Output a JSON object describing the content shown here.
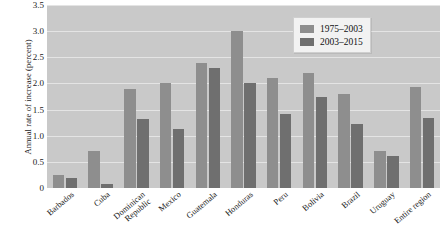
{
  "chart_data": {
    "type": "bar",
    "title": "",
    "xlabel": "",
    "ylabel": "Annual rate of increase (percent)",
    "ylim": [
      0,
      3.5
    ],
    "yticks": [
      "0",
      "0.5",
      "1.0",
      "1.5",
      "2.0",
      "2.5",
      "3.0",
      "3.5"
    ],
    "ytick_values": [
      0,
      0.5,
      1.0,
      1.5,
      2.0,
      2.5,
      3.0,
      3.5
    ],
    "grid": true,
    "legend_position": "top-right",
    "categories": [
      "Barbados",
      "Cuba",
      "Dominican Republic",
      "Mexico",
      "Guatemala",
      "Honduras",
      "Peru",
      "Bolivia",
      "Brazil",
      "Uruguay",
      "Entire region"
    ],
    "category_lines": [
      [
        "Barbados"
      ],
      [
        "Cuba"
      ],
      [
        "Dominican",
        "Republic"
      ],
      [
        "Mexico"
      ],
      [
        "Guatemala"
      ],
      [
        "Honduras"
      ],
      [
        "Peru"
      ],
      [
        "Bolivia"
      ],
      [
        "Brazil"
      ],
      [
        "Uruguay"
      ],
      [
        "Entire region"
      ]
    ],
    "series": [
      {
        "name": "1975–2003",
        "color": "#8e8e8e",
        "values": [
          0.25,
          0.7,
          1.9,
          2.0,
          2.4,
          3.0,
          2.1,
          2.2,
          1.8,
          0.7,
          1.93
        ]
      },
      {
        "name": "2003–2015",
        "color": "#6f6f6f",
        "values": [
          0.2,
          0.08,
          1.32,
          1.12,
          2.3,
          2.0,
          1.42,
          1.75,
          1.22,
          0.62,
          1.33
        ]
      }
    ]
  },
  "legend": {
    "items": [
      {
        "label": "1975–2003",
        "swatch": "series-0-swatch"
      },
      {
        "label": "2003–2015",
        "swatch": "series-1-swatch"
      }
    ]
  }
}
